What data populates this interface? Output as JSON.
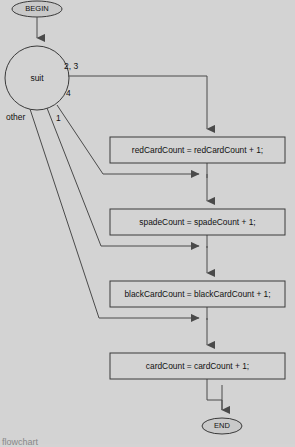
{
  "diagram": {
    "type": "flowchart",
    "background_color": "#d3d3d3",
    "line_color": "#4a4a4a",
    "terminators": {
      "begin": {
        "label": "BEGIN",
        "cx": 37,
        "cy": 9,
        "rx": 26,
        "ry": 8
      },
      "end": {
        "label": "END",
        "cx": 222,
        "cy": 426,
        "rx": 20,
        "ry": 8
      }
    },
    "decision": {
      "label": "suit",
      "shape": "circle",
      "cx": 37,
      "cy": 78,
      "r": 32
    },
    "processes": [
      {
        "id": "red",
        "label": "redCardCount = redCardCount + 1;",
        "x": 110,
        "y": 137,
        "width": 175,
        "height": 26
      },
      {
        "id": "spade",
        "label": "spadeCount = spadeCount + 1;",
        "x": 110,
        "y": 209,
        "width": 175,
        "height": 26
      },
      {
        "id": "black",
        "label": "blackCardCount = blackCardCount + 1;",
        "x": 110,
        "y": 281,
        "width": 175,
        "height": 26
      },
      {
        "id": "card",
        "label": "cardCount = cardCount + 1;",
        "x": 110,
        "y": 353,
        "width": 175,
        "height": 26
      }
    ],
    "edge_labels": [
      {
        "id": "two-three",
        "text": "2, 3",
        "x": 64,
        "y": 66
      },
      {
        "id": "four",
        "text": "4",
        "x": 66,
        "y": 93
      },
      {
        "id": "one",
        "text": "1",
        "x": 57,
        "y": 118
      },
      {
        "id": "other",
        "text": "other",
        "x": 7,
        "y": 117
      }
    ],
    "caption": "flowchart"
  }
}
